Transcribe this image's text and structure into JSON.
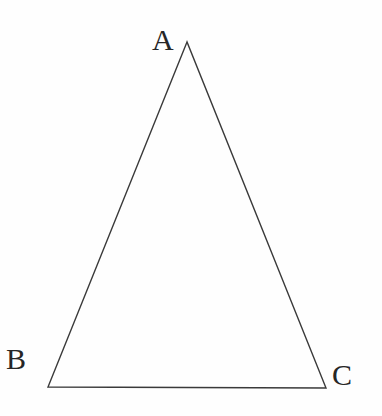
{
  "figure": {
    "type": "geometric-diagram",
    "shape": "triangle",
    "background_color": "#fefefe",
    "stroke_color": "#3a3a3a",
    "stroke_width": 1.4,
    "label_color": "#262626",
    "canvas": {
      "width": 382,
      "height": 416
    },
    "vertices": [
      {
        "name": "A",
        "label": "A",
        "x": 187,
        "y": 42,
        "label_x": 152,
        "label_y": 25
      },
      {
        "name": "B",
        "label": "B",
        "x": 48,
        "y": 387,
        "label_x": 6,
        "label_y": 344
      },
      {
        "name": "C",
        "label": "C",
        "x": 326,
        "y": 388,
        "label_x": 332,
        "label_y": 360
      }
    ],
    "edges": [
      {
        "name": "AB",
        "from": "A",
        "to": "B"
      },
      {
        "name": "BC",
        "from": "B",
        "to": "C"
      },
      {
        "name": "CA",
        "from": "C",
        "to": "A"
      }
    ],
    "path": "M 187 42 L 48 387 L 326 388 Z"
  }
}
